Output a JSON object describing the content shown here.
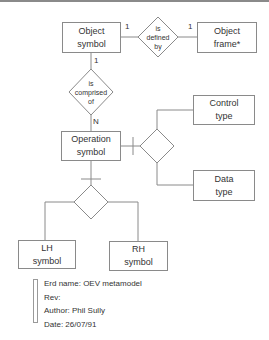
{
  "diagram": {
    "type": "entity-relationship",
    "entities": {
      "object_symbol": [
        "Object",
        "symbol"
      ],
      "object_frame": [
        "Object",
        "frame*"
      ],
      "operation_symbol": [
        "Operation",
        "symbol"
      ],
      "control_type": [
        "Control",
        "type"
      ],
      "data_type": [
        "Data",
        "type"
      ],
      "lh_symbol": [
        "LH",
        "symbol"
      ],
      "rh_symbol": [
        "RH",
        "symbol"
      ]
    },
    "relationships": {
      "is_defined_by": [
        "is",
        "defined",
        "by"
      ],
      "is_comprised_of": [
        "is",
        "comprised",
        "of"
      ]
    },
    "cardinalities": {
      "defined_left": "1",
      "defined_right": "1",
      "comprised_top": "1",
      "comprised_bottom": "N"
    },
    "legend": {
      "erd_name": "Erd name: OEV metamodel",
      "rev": "Rev:",
      "author": "Author: Phil Sully",
      "date": "Date: 26/07/91"
    },
    "colors": {
      "line": "#8a8a8a",
      "text": "#333333",
      "background": "#ffffff"
    }
  }
}
